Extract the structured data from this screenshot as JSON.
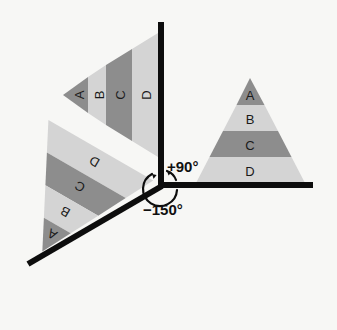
{
  "figure": {
    "background_color": "#f7f7f5",
    "axis_color": "#0d0d0d",
    "label_color": "#1a1a1a",
    "band_colors": {
      "dark": "#8d8d8d",
      "light": "#d4d4d4"
    },
    "vertex": {
      "x": 161,
      "y": 185
    }
  },
  "axes": [
    {
      "name": "vertical-axis",
      "from": {
        "x": 161,
        "y": 22
      },
      "to": {
        "x": 161,
        "y": 185
      }
    },
    {
      "name": "horizontal-axis",
      "from": {
        "x": 161,
        "y": 185
      },
      "to": {
        "x": 313,
        "y": 185
      }
    },
    {
      "name": "diagonal-axis",
      "from": {
        "x": 161,
        "y": 185
      },
      "to": {
        "x": 28,
        "y": 264
      }
    }
  ],
  "angles": [
    {
      "name": "positive-ninety",
      "label": "+90°",
      "value": 90,
      "unit": "degrees",
      "x": 167,
      "y": 166
    },
    {
      "name": "negative-one-fifty",
      "label": "−150°",
      "value": -150,
      "unit": "degrees",
      "x": 143,
      "y": 208
    }
  ],
  "triangles": [
    {
      "name": "upright-triangle",
      "rotation_degrees": 0,
      "apex": {
        "x": 250,
        "y": 78
      },
      "base_left": {
        "x": 196,
        "y": 183
      },
      "base_right": {
        "x": 305,
        "y": 183
      },
      "bands": [
        {
          "label": "A",
          "shade": "dark",
          "color": "#8d8d8d"
        },
        {
          "label": "B",
          "shade": "light",
          "color": "#d4d4d4"
        },
        {
          "label": "C",
          "shade": "dark",
          "color": "#8d8d8d"
        },
        {
          "label": "D",
          "shade": "light",
          "color": "#d4d4d4"
        }
      ]
    },
    {
      "name": "rotated-90-triangle",
      "rotation_degrees": 90,
      "apex": {
        "x": 63,
        "y": 95
      },
      "base_left": {
        "x": 158,
        "y": 33
      },
      "base_right": {
        "x": 158,
        "y": 157
      },
      "bands": [
        {
          "label": "A",
          "shade": "dark",
          "color": "#8d8d8d"
        },
        {
          "label": "B",
          "shade": "light",
          "color": "#d4d4d4"
        },
        {
          "label": "C",
          "shade": "dark",
          "color": "#8d8d8d"
        },
        {
          "label": "D",
          "shade": "light",
          "color": "#d4d4d4"
        }
      ]
    },
    {
      "name": "rotated-minus-150-triangle",
      "rotation_degrees": -150,
      "apex": {
        "x": 145,
        "y": 319
      },
      "base_left": {
        "x": 40,
        "y": 256
      },
      "base_right": {
        "x": 148,
        "y": 200
      },
      "bands": [
        {
          "label": "A",
          "shade": "dark",
          "color": "#8d8d8d"
        },
        {
          "label": "B",
          "shade": "light",
          "color": "#d4d4d4"
        },
        {
          "label": "C",
          "shade": "dark",
          "color": "#8d8d8d"
        },
        {
          "label": "D",
          "shade": "light",
          "color": "#d4d4d4"
        }
      ]
    }
  ]
}
